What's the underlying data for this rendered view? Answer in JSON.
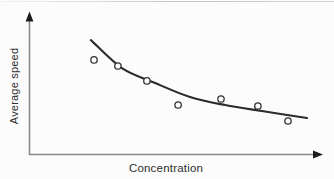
{
  "colors": {
    "bg": "#fcfcfc",
    "curve": "#2b2b2b",
    "point": "#333333",
    "axis": "#8a8a8a",
    "arrow": "#1c1c1c",
    "text": "#2f2f2f"
  },
  "chart_data": {
    "type": "scatter",
    "title": "",
    "xlabel": "Concentration",
    "ylabel": "Average speed",
    "axes_numeric_labels": false,
    "grid": false,
    "legend": "none",
    "units_note": "axes are unlabeled arrows; point coordinates given as percent of axis length",
    "x_range": [
      0,
      100
    ],
    "y_range": [
      0,
      100
    ],
    "points": [
      [
        22.9,
        67.9
      ],
      [
        31.3,
        63.6
      ],
      [
        41.5,
        52.9
      ],
      [
        52.5,
        35.7
      ],
      [
        67.6,
        40.0
      ],
      [
        80.6,
        35.0
      ],
      [
        91.2,
        24.3
      ]
    ],
    "fit_curve": {
      "shape": "decreasing convex decay",
      "points": [
        [
          21.8,
          82.1
        ],
        [
          32.7,
          62.1
        ],
        [
          44.4,
          51.4
        ],
        [
          56.7,
          41.4
        ],
        [
          69.0,
          35.7
        ],
        [
          82.0,
          31.4
        ],
        [
          97.9,
          26.4
        ]
      ]
    }
  }
}
